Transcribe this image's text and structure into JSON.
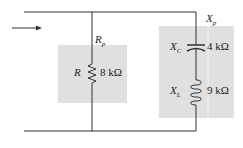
{
  "circuit": {
    "resistor": {
      "symbol": "R",
      "value": "8 kΩ",
      "group_label": "R",
      "group_sub": "p"
    },
    "capacitor": {
      "symbol": "X",
      "sub": "C",
      "value": "4 kΩ"
    },
    "inductor": {
      "symbol": "X",
      "sub": "L",
      "value": "9 kΩ"
    },
    "reactive_group": {
      "symbol": "X",
      "sub": "p"
    }
  },
  "colors": {
    "wire": "#333333",
    "box": "#e0e0e0"
  }
}
